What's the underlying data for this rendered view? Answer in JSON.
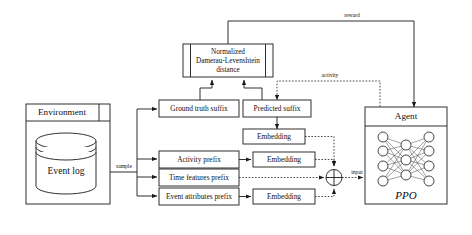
{
  "diagram": {
    "nodes": {
      "environment_header": "Environment",
      "event_log": "Event log",
      "distance": {
        "line1": "Normalized",
        "line2": "Damerau-Levenshtein",
        "line3": "distance"
      },
      "ground_truth_suffix": "Ground truth suffix",
      "predicted_suffix": "Predicted suffix",
      "activity_prefix": "Activity prefix",
      "time_features_prefix": "Time features prefix",
      "event_attributes_prefix": "Event attributes prefix",
      "embedding_1": "Embedding",
      "embedding_2": "Embedding",
      "embedding_3": "Embedding",
      "agent_header": "Agent",
      "agent_algorithm": "PPO"
    },
    "edge_labels": {
      "reward": "reward",
      "activity": "activity",
      "sample": "sample",
      "input": "input"
    },
    "network": {
      "input_nodes": 4,
      "hidden_nodes": 3,
      "output_nodes": 4
    },
    "colors": {
      "stroke": "#1a1a1a",
      "background": "#ffffff",
      "fill": "#ffffff"
    }
  }
}
